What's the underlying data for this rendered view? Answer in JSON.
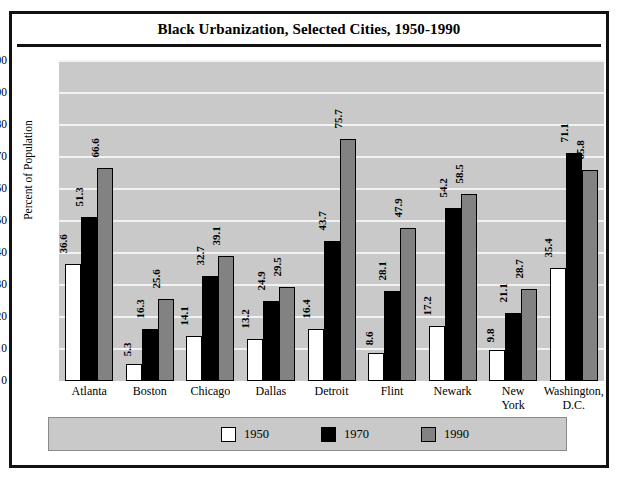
{
  "chart_data": {
    "type": "bar",
    "title": "Black Urbanization, Selected Cities, 1950-1990",
    "xlabel": "",
    "ylabel": "Percent of Population",
    "ylim": [
      0,
      100
    ],
    "ytick_step": 10,
    "yticks": [
      "100",
      "90",
      "80",
      "70",
      "60",
      "50",
      "40",
      "30",
      "20",
      "10",
      "0"
    ],
    "grid": true,
    "legend_position": "bottom",
    "categories": [
      "Atlanta",
      "Boston",
      "Chicago",
      "Dallas",
      "Detroit",
      "Flint",
      "Newark",
      "New York",
      "Washington, D.C."
    ],
    "category_lines": [
      [
        "Atlanta"
      ],
      [
        "Boston"
      ],
      [
        "Chicago"
      ],
      [
        "Dallas"
      ],
      [
        "Detroit"
      ],
      [
        "Flint"
      ],
      [
        "Newark"
      ],
      [
        "New",
        "York"
      ],
      [
        "Washington,",
        "D.C."
      ]
    ],
    "series": [
      {
        "name": "1950",
        "color": "#ffffff",
        "values": [
          36.6,
          5.3,
          14.1,
          13.2,
          16.4,
          8.6,
          17.2,
          9.8,
          35.4
        ],
        "labels": [
          "36.6",
          "5.3",
          "14.1",
          "13.2",
          "16.4",
          "8.6",
          "17.2",
          "9.8",
          "35.4"
        ]
      },
      {
        "name": "1970",
        "color": "#000000",
        "values": [
          51.3,
          16.3,
          32.7,
          24.9,
          43.7,
          28.1,
          54.2,
          21.1,
          71.1
        ],
        "labels": [
          "51.3",
          "16.3",
          "32.7",
          "24.9",
          "43.7",
          "28.1",
          "54.2",
          "21.1",
          "71.1"
        ]
      },
      {
        "name": "1990",
        "color": "#828282",
        "values": [
          66.6,
          25.6,
          39.1,
          29.5,
          75.7,
          47.9,
          58.5,
          28.7,
          65.8
        ],
        "labels": [
          "66.6",
          "25.6",
          "39.1",
          "29.5",
          "75.7",
          "47.9",
          "58.5",
          "28.7",
          "65.8"
        ]
      }
    ]
  },
  "legend": {
    "items": [
      {
        "label": "1950",
        "swatch": "white"
      },
      {
        "label": "1970",
        "swatch": "black"
      },
      {
        "label": "1990",
        "swatch": "gray"
      }
    ]
  },
  "colors": {
    "plot_background": "#c9c9c9",
    "gridline": "#f2f2f2",
    "frame": "#111111",
    "bar_1950": "#ffffff",
    "bar_1970": "#000000",
    "bar_1990": "#828282"
  }
}
